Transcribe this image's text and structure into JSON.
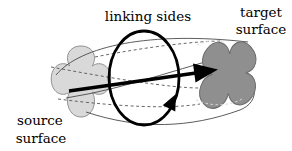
{
  "diagram": {
    "labels": {
      "linking_sides": "linking sides",
      "target_surface_line1": "target",
      "target_surface_line2": "surface",
      "source_surface_line1": "source",
      "source_surface_line2": "surface"
    },
    "colors": {
      "background": "#ffffff",
      "source_surface_fill": "#d9d9d9",
      "source_surface_outline": "#8c8c8c",
      "target_surface_fill": "#8f8f8f",
      "target_surface_outline": "#6b6b6b",
      "hidden_dash_color": "#d8d8d8",
      "bold_stroke": "#000000"
    }
  }
}
